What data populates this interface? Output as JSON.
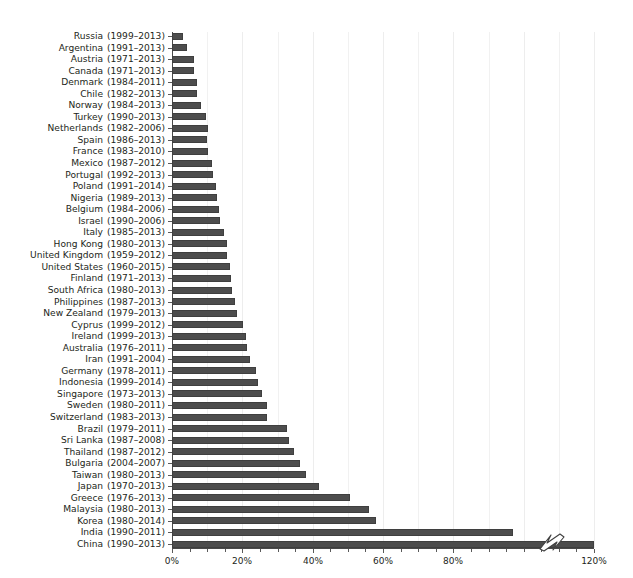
{
  "caption": {
    "text": "(a truncated caption line, clipped at the top edge of the image) ... per capita income levels are also projected for each country."
  },
  "chart_data": {
    "type": "bar",
    "orientation": "horizontal",
    "title": "",
    "xlabel": "",
    "ylabel": "",
    "xlim": [
      0,
      120
    ],
    "xticks": [
      0,
      20,
      40,
      60,
      80,
      120
    ],
    "xtick_labels": [
      "0%",
      "20%",
      "40%",
      "60%",
      "80%",
      "120%"
    ],
    "axis_break": {
      "present": true,
      "between": [
        80,
        120
      ],
      "marker": "zigzag",
      "note": "x-axis is broken between 80% and 120%; the China bar is truncated with a zigzag glyph"
    },
    "grid": {
      "x": true,
      "y": false,
      "interval": 10
    },
    "legend": {
      "present": false
    },
    "bar_color": "#4d4d4d",
    "categories": [
      "Russia",
      "Argentina",
      "Austria",
      "Canada",
      "Denmark",
      "Chile",
      "Norway",
      "Turkey",
      "Netherlands",
      "Spain",
      "France",
      "Mexico",
      "Portugal",
      "Poland",
      "Nigeria",
      "Belgium",
      "Israel",
      "Italy",
      "Hong Kong",
      "United Kingdom",
      "United States",
      "Finland",
      "South Africa",
      "Philippines",
      "New Zealand",
      "Cyprus",
      "Ireland",
      "Australia",
      "Iran",
      "Germany",
      "Indonesia",
      "Singapore",
      "Sweden",
      "Switzerland",
      "Brazil",
      "Sri Lanka",
      "Thailand",
      "Bulgaria",
      "Taiwan",
      "Japan",
      "Greece",
      "Malaysia",
      "Korea",
      "India",
      "China"
    ],
    "period_labels": [
      "(1999–2013)",
      "(1991–2013)",
      "(1971–2013)",
      "(1971–2013)",
      "(1984–2011)",
      "(1982–2013)",
      "(1984–2013)",
      "(1990–2013)",
      "(1982–2006)",
      "(1986–2013)",
      "(1983–2010)",
      "(1987–2012)",
      "(1992–2013)",
      "(1991–2014)",
      "(1989–2013)",
      "(1984–2006)",
      "(1990–2006)",
      "(1985–2013)",
      "(1980–2013)",
      "(1959–2012)",
      "(1960–2015)",
      "(1971–2013)",
      "(1980–2013)",
      "(1987–2013)",
      "(1979–2013)",
      "(1999–2012)",
      "(1999–2013)",
      "(1976–2011)",
      "(1991–2004)",
      "(1978–2011)",
      "(1999–2014)",
      "(1973–2013)",
      "(1980–2011)",
      "(1983–2013)",
      "(1979–2011)",
      "(1987–2008)",
      "(1987–2012)",
      "(2004–2007)",
      "(1980–2013)",
      "(1970–2013)",
      "(1976–2013)",
      "(1980–2013)",
      "(1980–2014)",
      "(1990–2011)",
      "(1990–2013)"
    ],
    "values": [
      3.2,
      4.3,
      6.3,
      6.3,
      7.2,
      7.2,
      8.3,
      9.6,
      10.1,
      10.0,
      10.3,
      11.3,
      11.8,
      12.5,
      12.9,
      13.3,
      13.7,
      14.8,
      15.5,
      15.6,
      16.6,
      16.8,
      17.2,
      18.0,
      18.4,
      20.2,
      21.0,
      21.4,
      22.3,
      23.9,
      24.5,
      25.7,
      26.9,
      27.1,
      32.7,
      33.3,
      34.7,
      36.3,
      38.0,
      41.8,
      50.6,
      55.9,
      58.1,
      97.0,
      120.0
    ],
    "value_unit": "%",
    "values_note": "bar lengths read off the percentage axis; China extends past the axis break to the 120% end"
  },
  "axis": {
    "break_glyph_name": "axis-break-zigzag"
  }
}
